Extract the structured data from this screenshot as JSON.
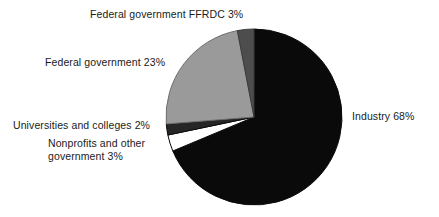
{
  "chart_data": {
    "type": "pie",
    "title": "",
    "subtitle": "",
    "xlabel": "",
    "ylabel": "",
    "legend_position": "none",
    "grid": false,
    "start_angle_deg": 0,
    "direction": "clockwise",
    "categories": [
      "Industry",
      "Nonprofits and other government",
      "Universities and colleges",
      "Federal government",
      "Federal government FFRDC"
    ],
    "values": [
      68,
      3,
      2,
      23,
      3
    ],
    "units": "percent",
    "slices": [
      {
        "name": "Industry",
        "value": 68,
        "label": "Industry 68%",
        "color": "#0a0a0a",
        "stroke": "#0a0a0a"
      },
      {
        "name": "Nonprofits and other government",
        "value": 3,
        "label": "Nonprofits and other government 3%",
        "label_line_1": "Nonprofits and other",
        "label_line_2": "government 3%",
        "color": "#ffffff",
        "stroke": "#0a0a0a"
      },
      {
        "name": "Universities and colleges",
        "value": 2,
        "label": "Universities and colleges 2%",
        "color": "#262626",
        "stroke": "#0a0a0a"
      },
      {
        "name": "Federal government",
        "value": 23,
        "label": "Federal government 23%",
        "color": "#9a9a9a",
        "stroke": "#6e6e6e"
      },
      {
        "name": "Federal government FFRDC",
        "value": 3,
        "label": "Federal government FFRDC 3%",
        "color": "#4d4d4d",
        "stroke": "#3a3a3a"
      }
    ]
  },
  "labels": {
    "industry": "Industry 68%",
    "nonprofits_line1": "Nonprofits and other",
    "nonprofits_line2": "government 3%",
    "universities": "Universities and colleges 2%",
    "federal_government": "Federal government 23%",
    "federal_government_ffrdc": "Federal government FFRDC 3%"
  },
  "geometry": {
    "center_x": 254,
    "center_y": 117,
    "radius": 88
  },
  "colors": {
    "background": "#ffffff",
    "text": "#1a1a1a",
    "industry": "#0a0a0a",
    "federal_government": "#9a9a9a",
    "federal_government_ffrdc": "#4d4d4d",
    "universities": "#262626",
    "nonprofits": "#ffffff"
  }
}
